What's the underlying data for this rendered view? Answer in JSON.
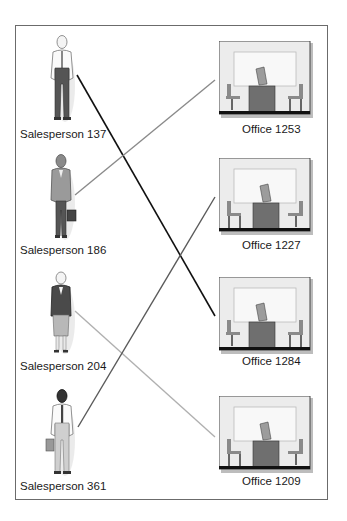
{
  "diagram": {
    "salespersons": [
      {
        "id": "137",
        "label": "Salesperson 137",
        "style": "man-white-shirt"
      },
      {
        "id": "186",
        "label": "Salesperson 186",
        "style": "woman-gray-suit-briefcase"
      },
      {
        "id": "204",
        "label": "Salesperson 204",
        "style": "woman-dark-jacket-skirt"
      },
      {
        "id": "361",
        "label": "Salesperson 361",
        "style": "man-dark-hair-briefcase"
      }
    ],
    "offices": [
      {
        "id": "1253",
        "label": "Office 1253"
      },
      {
        "id": "1227",
        "label": "Office 1227"
      },
      {
        "id": "1284",
        "label": "Office 1284"
      },
      {
        "id": "1209",
        "label": "Office 1209"
      }
    ],
    "links": [
      {
        "from": "Salesperson 137",
        "to": "Office 1284",
        "color": "#111111"
      },
      {
        "from": "Salesperson 186",
        "to": "Office 1253",
        "color": "#8a8a8a"
      },
      {
        "from": "Salesperson 204",
        "to": "Office 1209",
        "color": "#b0b0b0"
      },
      {
        "from": "Salesperson 361",
        "to": "Office 1227",
        "color": "#5a5a5a"
      }
    ]
  }
}
